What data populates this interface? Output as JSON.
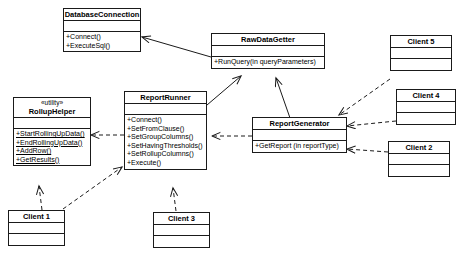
{
  "diagram": {
    "type": "uml-class-diagram",
    "background_color": "#ffffff",
    "line_color": "#1a1a1a"
  },
  "classes": [
    {
      "id": "database-connection",
      "name": "DatabaseConnection",
      "stereotype": "",
      "attributes": [],
      "operations": [
        {
          "label": "+Connect()",
          "static": false
        },
        {
          "label": "+ExecuteSql()",
          "static": false
        }
      ]
    },
    {
      "id": "raw-data-getter",
      "name": "RawDataGetter",
      "stereotype": "",
      "attributes": [],
      "operations": [
        {
          "label": "+RunQuery(in queryParameters)",
          "static": false
        }
      ]
    },
    {
      "id": "rollup-helper",
      "name": "RollupHelper",
      "stereotype": "«utility»",
      "attributes": [],
      "operations": [
        {
          "label": "+StartRollingUpData()",
          "static": true
        },
        {
          "label": "+EndRollingUpData()",
          "static": true
        },
        {
          "label": "+AddRow()",
          "static": true
        },
        {
          "label": "+GetResults()",
          "static": true
        }
      ]
    },
    {
      "id": "report-runner",
      "name": "ReportRunner",
      "stereotype": "",
      "attributes": [],
      "operations": [
        {
          "label": "+Connect()",
          "static": false
        },
        {
          "label": "+SetFromClause()",
          "static": false
        },
        {
          "label": "+SetGroupColumns()",
          "static": false
        },
        {
          "label": "+SetHavingThresholds()",
          "static": false
        },
        {
          "label": "+SetRollupColumns()",
          "static": false
        },
        {
          "label": "+Execute()",
          "static": false
        }
      ]
    },
    {
      "id": "report-generator",
      "name": "ReportGenerator",
      "stereotype": "",
      "attributes": [],
      "operations": [
        {
          "label": "+GetReport (in reportType)",
          "static": false
        }
      ]
    },
    {
      "id": "client-5",
      "name": "Client 5",
      "stereotype": "",
      "attributes": [],
      "operations": []
    },
    {
      "id": "client-4",
      "name": "Client 4",
      "stereotype": "",
      "attributes": [],
      "operations": []
    },
    {
      "id": "client-2",
      "name": "Client 2",
      "stereotype": "",
      "attributes": [],
      "operations": []
    },
    {
      "id": "client-1",
      "name": "Client 1",
      "stereotype": "",
      "attributes": [],
      "operations": []
    },
    {
      "id": "client-3",
      "name": "Client 3",
      "stereotype": "",
      "attributes": [],
      "operations": []
    }
  ],
  "relationships": [
    {
      "id": "rawdatagetter-to-databaseconnection",
      "from": "raw-data-getter",
      "to": "database-connection",
      "style": "solid",
      "arrow": "open"
    },
    {
      "id": "reportrunner-to-rawdatagetter",
      "from": "report-runner",
      "to": "raw-data-getter",
      "style": "solid",
      "arrow": "open"
    },
    {
      "id": "reportgenerator-to-rawdatagetter",
      "from": "report-generator",
      "to": "raw-data-getter",
      "style": "solid",
      "arrow": "open"
    },
    {
      "id": "reportrunner-to-rolluphelper",
      "from": "report-runner",
      "to": "rollup-helper",
      "style": "dashed",
      "arrow": "open"
    },
    {
      "id": "reportgenerator-to-reportrunner",
      "from": "report-generator",
      "to": "report-runner",
      "style": "dashed",
      "arrow": "open"
    },
    {
      "id": "client5-to-reportgenerator",
      "from": "client-5",
      "to": "report-generator",
      "style": "dashed",
      "arrow": "open"
    },
    {
      "id": "client4-to-reportgenerator",
      "from": "client-4",
      "to": "report-generator",
      "style": "dashed",
      "arrow": "open"
    },
    {
      "id": "client2-to-reportgenerator",
      "from": "client-2",
      "to": "report-generator",
      "style": "dashed",
      "arrow": "open"
    },
    {
      "id": "client1-to-rolluphelper",
      "from": "client-1",
      "to": "rollup-helper",
      "style": "dashed",
      "arrow": "open"
    },
    {
      "id": "client1-to-reportrunner",
      "from": "client-1",
      "to": "report-runner",
      "style": "dashed",
      "arrow": "open"
    },
    {
      "id": "client3-to-reportrunner",
      "from": "client-3",
      "to": "report-runner",
      "style": "dashed",
      "arrow": "open"
    }
  ]
}
